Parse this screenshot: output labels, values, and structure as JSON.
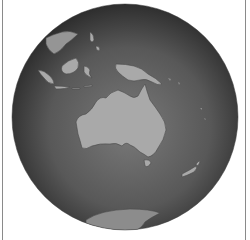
{
  "map": {
    "projection": "orthographic",
    "center_region": "Australia",
    "colors": {
      "ocean_center": "#6e6e6e",
      "ocean_edge": "#2e2e2e",
      "land": "#a9a9a9",
      "land_border": "#4a4a4a",
      "frame": "#8a8a8a",
      "background": "#ffffff"
    },
    "landmasses": [
      "Australia",
      "New Guinea",
      "Indonesia",
      "Borneo",
      "Sumatra",
      "Philippines",
      "New Zealand",
      "Tasmania",
      "Antarctica"
    ]
  }
}
